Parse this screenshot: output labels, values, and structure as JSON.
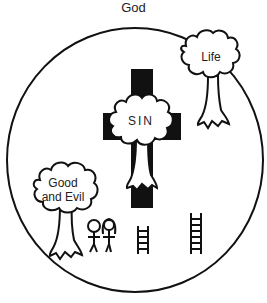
{
  "title": "God",
  "labels": {
    "sin": "SIN",
    "tree_life": "Life",
    "tree_knowledge_line1": "Good",
    "tree_knowledge_line2": "and Evil"
  },
  "elements": {
    "circle": "world-circle",
    "cross": "cross-black",
    "people_count": 2,
    "ladders_count": 2
  },
  "colors": {
    "ink": "#111111",
    "background": "#ffffff"
  }
}
